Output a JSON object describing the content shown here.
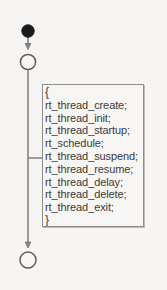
{
  "diagram": {
    "type": "uml-activity-diagram",
    "background_color": "#f6f5f3",
    "stroke_color": "#6f6e6c",
    "text_color": "#3a3a3a",
    "nodes": {
      "start_node": {
        "shape": "filled-circle",
        "label": "",
        "fill": "#1a1a1a"
      },
      "state_node_top": {
        "shape": "hollow-circle",
        "label": "",
        "fill": "#f7f6f4"
      },
      "state_node_bottom": {
        "shape": "hollow-circle",
        "label": "",
        "fill": "#f7f6f4"
      }
    },
    "code_note": {
      "open_brace": "{",
      "close_brace": "}",
      "statements": [
        "rt_thread_create;",
        "rt_thread_init;",
        "rt_thread_startup;",
        "rt_schedule;",
        "rt_thread_suspend;",
        "rt_thread_resume;",
        "rt_thread_delay;",
        "rt_thread_delete;",
        "rt_thread_exit;"
      ]
    }
  }
}
